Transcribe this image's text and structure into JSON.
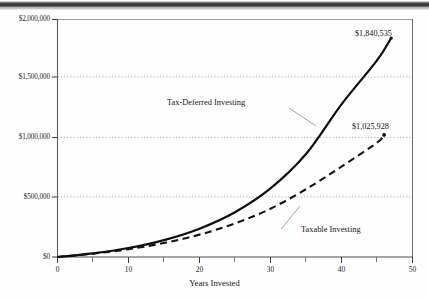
{
  "chart_data": {
    "type": "line",
    "title": "",
    "xlabel": "Years Invested",
    "ylabel": "",
    "xlim": [
      0,
      50
    ],
    "ylim": [
      0,
      2000000
    ],
    "grid": true,
    "legend_position": "inline-annotations",
    "x_ticks": [
      "0",
      "10",
      "20",
      "30",
      "40",
      "50"
    ],
    "x_tick_values": [
      0,
      10,
      20,
      30,
      40,
      50
    ],
    "x_minor_tick_values": [
      5,
      15,
      25,
      35,
      45
    ],
    "y_ticks": [
      "$0",
      "$500,000",
      "$1,000,000",
      "$1,500,000",
      "$2,000,000"
    ],
    "y_tick_values": [
      0,
      500000,
      1000000,
      1500000,
      2000000
    ],
    "series": [
      {
        "name": "Tax-Deferred Investing",
        "style": "solid",
        "color": "#111111",
        "end_label": "$1,840,535",
        "end_value": 1840535,
        "end_x": 47,
        "x": [
          0,
          5,
          10,
          15,
          20,
          25,
          30,
          35,
          40,
          45,
          47
        ],
        "values": [
          0,
          31000,
          76000,
          142000,
          238000,
          376000,
          576000,
          865000,
          1283000,
          1652000,
          1840535
        ]
      },
      {
        "name": "Taxable Investing",
        "style": "dashed",
        "color": "#111111",
        "end_label": "$1,025,928",
        "end_value": 1025928,
        "end_x": 46,
        "x": [
          0,
          5,
          10,
          15,
          20,
          25,
          30,
          35,
          40,
          45,
          46
        ],
        "values": [
          0,
          28000,
          66000,
          118000,
          188000,
          282000,
          406000,
          570000,
          760000,
          960000,
          1025928
        ]
      }
    ]
  },
  "axis": {
    "x_title": "Years Invested"
  },
  "annotations": {
    "tax_deferred_label": "Tax-Deferred Investing",
    "taxable_label": "Taxable Investing",
    "tax_deferred_value": "$1,840,535",
    "taxable_value": "$1,025,928"
  },
  "y_labels": {
    "t0": "$0",
    "t1": "$500,000",
    "t2": "$1,000,000",
    "t3": "$1,500,000",
    "t4": "$2,000,000"
  },
  "x_labels": {
    "t0": "0",
    "t1": "10",
    "t2": "20",
    "t3": "30",
    "t4": "40",
    "t5": "50"
  },
  "colors": {
    "line": "#111111",
    "grid": "#8f8f8f",
    "axis": "#4a4a4a",
    "text": "#1a1a1a"
  }
}
